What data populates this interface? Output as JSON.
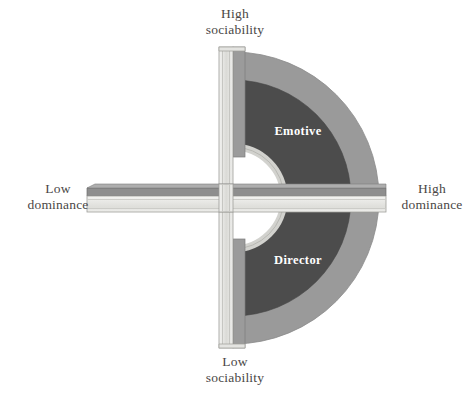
{
  "figure": {
    "type": "diagram",
    "axes": [
      {
        "id": "sociability",
        "orientation": "vertical",
        "high_label_line1": "High",
        "high_label_line2": "sociability",
        "low_label_line1": "Low",
        "low_label_line2": "sociability"
      },
      {
        "id": "dominance",
        "orientation": "horizontal",
        "high_label_line1": "High",
        "high_label_line2": "dominance",
        "low_label_line1": "Low",
        "low_label_line2": "dominance"
      }
    ],
    "labels": {
      "high_sociability_1": "High",
      "high_sociability_2": "sociability",
      "low_sociability_1": "Low",
      "low_sociability_2": "sociability",
      "low_dominance_1": "Low",
      "low_dominance_2": "dominance",
      "high_dominance_1": "High",
      "high_dominance_2": "dominance"
    },
    "regions": [
      {
        "id": "emotive",
        "name": "Emotive",
        "quadrant": "high-sociability / high-dominance",
        "fill": "#4c4c4c"
      },
      {
        "id": "director",
        "name": "Director",
        "quadrant": "low-sociability / high-dominance",
        "fill": "#4c4c4c"
      }
    ],
    "colors": {
      "background": "#ffffff",
      "outer_ring": "#9a9a9a",
      "inner_wedge": "#4c4c4c",
      "bar_face_light": "#ececea",
      "bar_face_mid": "#d6d6d2",
      "bar_top_dark": "#8d8d8d",
      "bar_edge_dark": "#6e6e6e",
      "center_hole": "#ffffff",
      "center_rim": "#d9d9d6",
      "outline": "#7a7a7a",
      "label_text": "#4a4746",
      "region_text": "#ffffff"
    },
    "geometry": {
      "center_x": 233,
      "center_y": 198,
      "outer_radius": 146,
      "wedge_radius": 118,
      "hole_radius": 51,
      "vertical_bar_top": 47,
      "vertical_bar_bottom": 348,
      "horizontal_bar_left": 87,
      "horizontal_bar_right": 386
    }
  }
}
